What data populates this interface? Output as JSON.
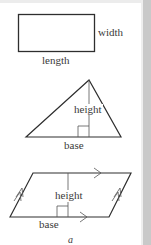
{
  "figure": {
    "caption": "a",
    "colors": {
      "stroke": "#2e2e2e",
      "text": "#3a3a3a",
      "side_strip": "#c9c9c9",
      "background": "#ffffff"
    },
    "shapes": [
      {
        "name": "rectangle",
        "labels": {
          "side": "width",
          "bottom": "length"
        }
      },
      {
        "name": "triangle",
        "labels": {
          "height": "height",
          "base": "base"
        }
      },
      {
        "name": "parallelogram",
        "labels": {
          "height": "height",
          "base": "base"
        }
      }
    ]
  }
}
